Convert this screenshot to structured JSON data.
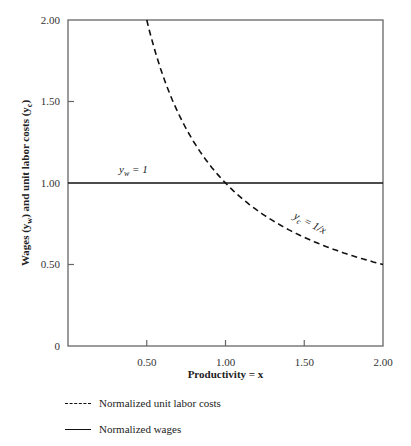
{
  "chart_data": {
    "type": "line",
    "title": "",
    "xlabel": "Productivity = x",
    "ylabel": "Wages (y_w) and unit labor costs (y_c)",
    "xlim": [
      0,
      2
    ],
    "ylim": [
      0,
      2
    ],
    "x_ticks": [
      "0.50",
      "1.00",
      "1.50",
      "2.00"
    ],
    "y_ticks": [
      "0",
      "0.50",
      "1.00",
      "1.50",
      "2.00"
    ],
    "grid": false,
    "series": [
      {
        "name": "Normalized unit labor costs",
        "style": "dashed",
        "formula": "y_c = 1/x",
        "x": [
          0.5,
          0.6,
          0.75,
          1.0,
          1.25,
          1.5,
          1.75,
          2.0
        ],
        "values": [
          2.0,
          1.667,
          1.333,
          1.0,
          0.8,
          0.667,
          0.571,
          0.5
        ]
      },
      {
        "name": "Normalized wages",
        "style": "solid",
        "formula": "y_w = 1",
        "x": [
          0,
          2
        ],
        "values": [
          1,
          1
        ]
      }
    ],
    "annotations": [
      {
        "text": "y_w = 1",
        "x": 0.35,
        "y": 1.07
      },
      {
        "text": "y_c = 1/x",
        "x": 1.45,
        "y": 0.75
      }
    ],
    "legend_position": "bottom-left"
  },
  "labels": {
    "x_axis": "Productivity = x",
    "y_axis_prefix": "Wages (",
    "y_w": "y",
    "y_w_sub": "w",
    "y_mid": ") and unit labor costs (",
    "y_c_sub": "c",
    "y_end": ")",
    "ann_yw": "y",
    "ann_yw_sub": "w",
    "ann_yw_rest": " = 1",
    "ann_yc": "y",
    "ann_yc_sub": "c",
    "ann_yc_rest": " = 1/x"
  },
  "legend": [
    {
      "label": "Normalized unit labor costs"
    },
    {
      "label": "Normalized wages"
    }
  ]
}
